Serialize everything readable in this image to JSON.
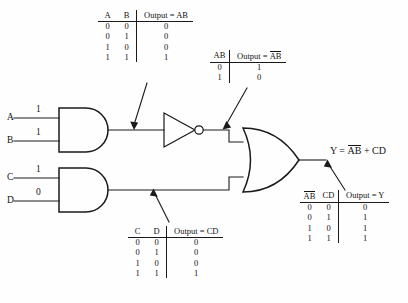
{
  "diagram": {
    "background_color": "#fefefe",
    "line_color": "#1a1a1a"
  },
  "inputs": [
    {
      "name": "A",
      "label": "A",
      "value": "1"
    },
    {
      "name": "B",
      "label": "B",
      "value": "1"
    },
    {
      "name": "C",
      "label": "C",
      "value": "1"
    },
    {
      "name": "D",
      "label": "D",
      "value": "0"
    }
  ],
  "gates": [
    {
      "name": "and-gate-ab",
      "type": "AND",
      "inputs": [
        "A",
        "B"
      ],
      "output": "AB"
    },
    {
      "name": "not-gate",
      "type": "NOT",
      "inputs": [
        "AB"
      ],
      "output": "notAB"
    },
    {
      "name": "and-gate-cd",
      "type": "AND",
      "inputs": [
        "C",
        "D"
      ],
      "output": "CD"
    },
    {
      "name": "or-gate",
      "type": "OR",
      "inputs": [
        "notAB",
        "CD"
      ],
      "output": "Y"
    }
  ],
  "output": {
    "label_prefix": "Y = ",
    "term1_overline": "AB",
    "plus": " + ",
    "term2": "CD",
    "full": "Y = AB + CD"
  },
  "tables": {
    "ab": {
      "name": "truth-table-ab",
      "headers": [
        "A",
        "B",
        "Output = AB"
      ],
      "output_header_plain": "Output = AB",
      "rows": [
        [
          "0",
          "0",
          "0"
        ],
        [
          "0",
          "1",
          "0"
        ],
        [
          "1",
          "0",
          "0"
        ],
        [
          "1",
          "1",
          "1"
        ]
      ]
    },
    "notab": {
      "name": "truth-table-not-ab",
      "headers": [
        "AB",
        "Output = AB"
      ],
      "output_header_prefix": "Output = ",
      "output_header_overline": "AB",
      "rows": [
        [
          "0",
          "1"
        ],
        [
          "1",
          "0"
        ]
      ]
    },
    "cd": {
      "name": "truth-table-cd",
      "headers": [
        "C",
        "D",
        "Output = CD"
      ],
      "output_header_plain": "Output = CD",
      "rows": [
        [
          "0",
          "0",
          "0"
        ],
        [
          "0",
          "1",
          "0"
        ],
        [
          "1",
          "0",
          "0"
        ],
        [
          "1",
          "1",
          "1"
        ]
      ]
    },
    "y": {
      "name": "truth-table-y",
      "header_overline": "AB",
      "headers": [
        "AB",
        "CD",
        "Output = Y"
      ],
      "output_header_plain": "Output = Y",
      "rows": [
        [
          "0",
          "0",
          "0"
        ],
        [
          "0",
          "1",
          "1"
        ],
        [
          "1",
          "0",
          "1"
        ],
        [
          "1",
          "1",
          "1"
        ]
      ]
    }
  }
}
